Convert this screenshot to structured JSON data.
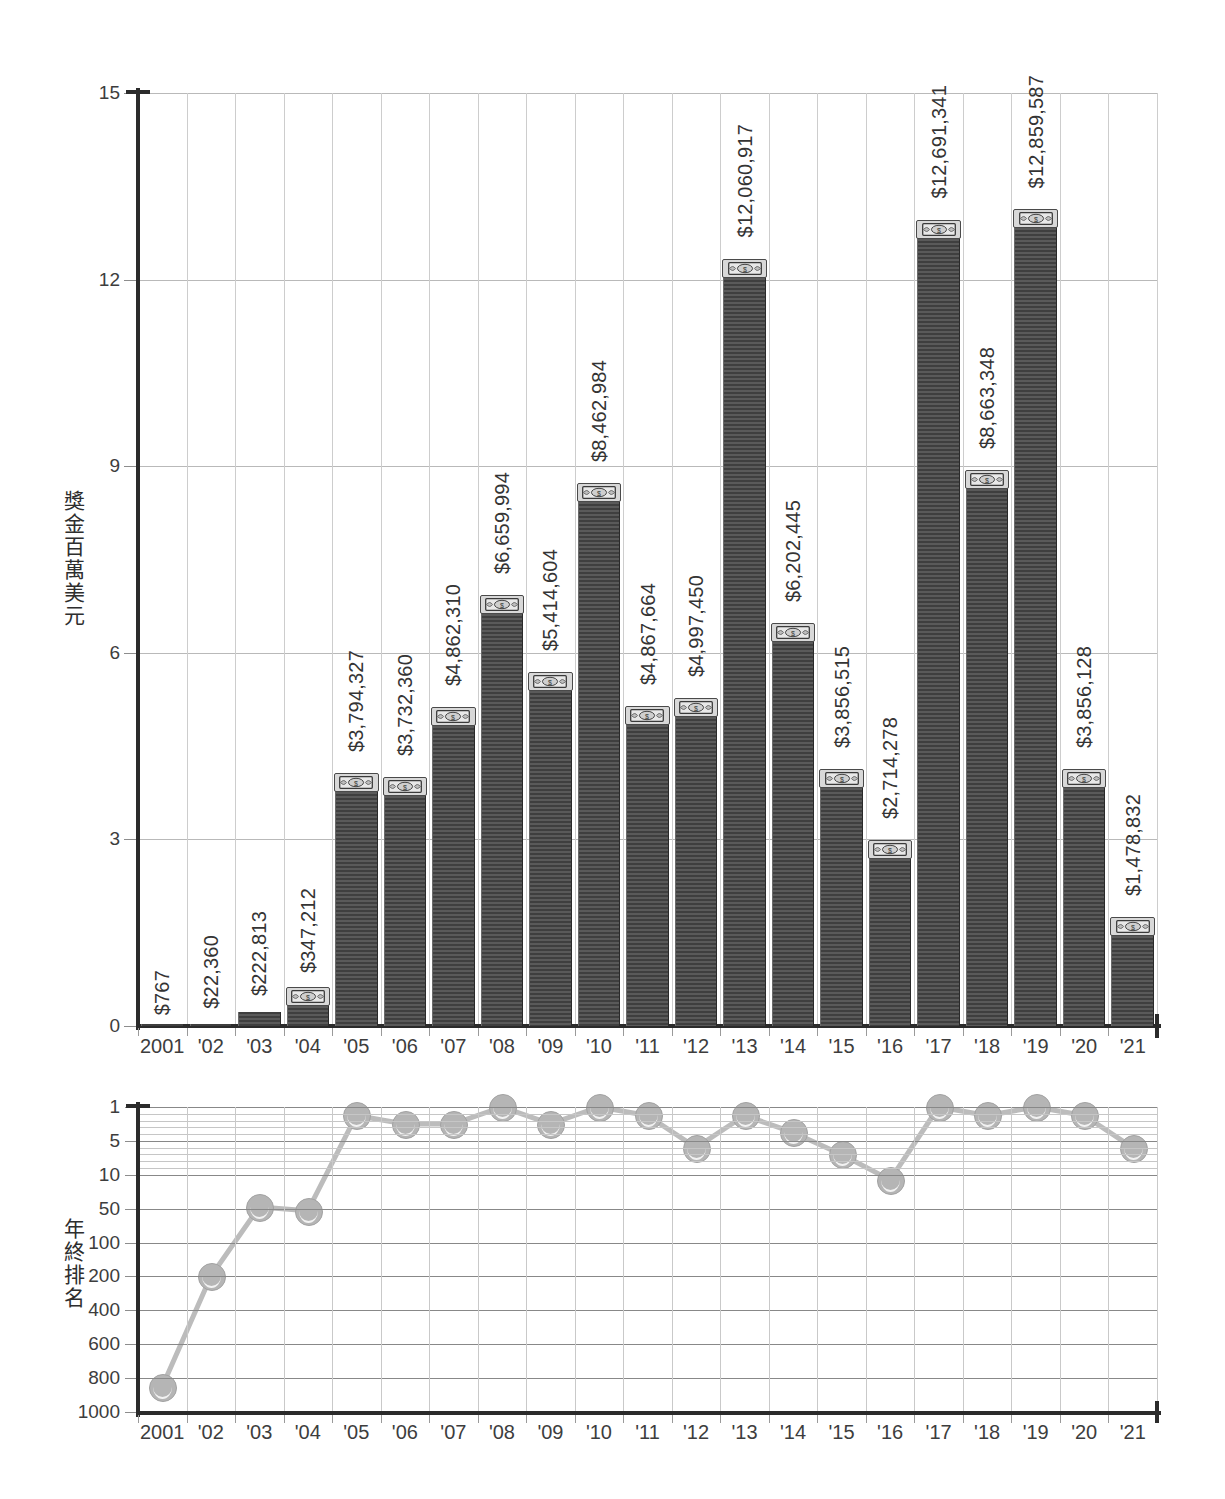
{
  "chart_data": [
    {
      "type": "bar",
      "id": "prize-money",
      "title": "",
      "ylabel": "獎金百萬美元",
      "xlabel": "",
      "ylim": [
        0,
        15
      ],
      "yticks": [
        0,
        3,
        6,
        9,
        12,
        15
      ],
      "ytick_labels": [
        "0",
        "3",
        "6",
        "9",
        "12",
        "15"
      ],
      "grid": true,
      "unit_note": "millions of USD",
      "categories": [
        "2001",
        "'02",
        "'03",
        "'04",
        "'05",
        "'06",
        "'07",
        "'08",
        "'09",
        "'10",
        "'11",
        "'12",
        "'13",
        "'14",
        "'15",
        "'16",
        "'17",
        "'18",
        "'19",
        "'20",
        "'21"
      ],
      "values": [
        767,
        22360,
        222813,
        347212,
        3794327,
        3732360,
        4862310,
        6659994,
        5414604,
        8462984,
        4867664,
        4997450,
        12060917,
        6202445,
        3856515,
        2714278,
        12691341,
        8663348,
        12859587,
        3856128,
        1478832
      ],
      "value_labels": [
        "$767",
        "$22,360",
        "$222,813",
        "$347,212",
        "$3,794,327",
        "$3,732,360",
        "$4,862,310",
        "$6,659,994",
        "$5,414,604",
        "$8,462,984",
        "$4,867,664",
        "$4,997,450",
        "$12,060,917",
        "$6,202,445",
        "$3,856,515",
        "$2,714,278",
        "$12,691,341",
        "$8,663,348",
        "$12,859,587",
        "$3,856,128",
        "$1,478,832"
      ],
      "bar_color": "#4a4a4a",
      "bar_cap_icon": "banknote-icon"
    },
    {
      "type": "line",
      "id": "year-end-ranking",
      "title": "",
      "ylabel": "年終排名",
      "xlabel": "",
      "yscale": "inverted-rank",
      "yticks": [
        1,
        5,
        10,
        50,
        100,
        200,
        400,
        600,
        800,
        1000
      ],
      "ytick_labels": [
        "1",
        "5",
        "10",
        "50",
        "100",
        "200",
        "400",
        "600",
        "800",
        "1000"
      ],
      "grid": true,
      "categories": [
        "2001",
        "'02",
        "'03",
        "'04",
        "'05",
        "'06",
        "'07",
        "'08",
        "'09",
        "'10",
        "'11",
        "'12",
        "'13",
        "'14",
        "'15",
        "'16",
        "'17",
        "'18",
        "'19",
        "'20",
        "'21"
      ],
      "values": [
        850,
        200,
        48,
        53,
        2,
        3,
        3,
        1,
        3,
        1,
        2,
        6,
        2,
        4,
        7,
        16,
        1,
        2,
        1,
        2,
        6
      ],
      "marker": "tennis-ball-icon",
      "line_color": "#bcbcbc",
      "marker_color": "#b5b5b5"
    }
  ],
  "bar_chart": {
    "yaxis_label": "獎金百萬美元",
    "yticks": [
      "0",
      "3",
      "6",
      "9",
      "12",
      "15"
    ],
    "xticks": [
      "2001",
      "'02",
      "'03",
      "'04",
      "'05",
      "'06",
      "'07",
      "'08",
      "'09",
      "'10",
      "'11",
      "'12",
      "'13",
      "'14",
      "'15",
      "'16",
      "'17",
      "'18",
      "'19",
      "'20",
      "'21"
    ],
    "bar_labels": [
      "$767",
      "$22,360",
      "$222,813",
      "$347,212",
      "$3,794,327",
      "$3,732,360",
      "$4,862,310",
      "$6,659,994",
      "$5,414,604",
      "$8,462,984",
      "$4,867,664",
      "$4,997,450",
      "$12,060,917",
      "$6,202,445",
      "$3,856,515",
      "$2,714,278",
      "$12,691,341",
      "$8,663,348",
      "$12,859,587",
      "$3,856,128",
      "$1,478,832"
    ]
  },
  "rank_chart": {
    "yaxis_label": "年終排名",
    "yticks": [
      "1",
      "5",
      "10",
      "50",
      "100",
      "200",
      "400",
      "600",
      "800",
      "1000"
    ],
    "xticks": [
      "2001",
      "'02",
      "'03",
      "'04",
      "'05",
      "'06",
      "'07",
      "'08",
      "'09",
      "'10",
      "'11",
      "'12",
      "'13",
      "'14",
      "'15",
      "'16",
      "'17",
      "'18",
      "'19",
      "'20",
      "'21"
    ]
  },
  "colors": {
    "bar_dark": "#3f3f3f",
    "bar_light": "#5a5a5a",
    "axis": "#2b2b2b",
    "grid_major": "#b9b9b9",
    "grid_minor": "#cdcdcd",
    "marker": "#b5b5b5",
    "text": "#3a3a3a"
  }
}
